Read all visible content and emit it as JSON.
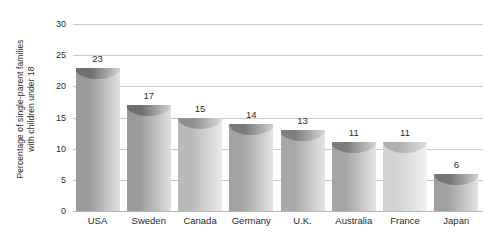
{
  "chart_data": {
    "type": "bar",
    "title": "",
    "xlabel": "",
    "ylabel_line1": "Percentage of single-parent families",
    "ylabel_line2": "with children under 18",
    "categories": [
      "USA",
      "Sweden",
      "Canada",
      "Germany",
      "U.K.",
      "Australia",
      "France",
      "Japan"
    ],
    "values": [
      23,
      17,
      15,
      14,
      13,
      11,
      11,
      6
    ],
    "value_labels": [
      "23",
      "17",
      "15",
      "14",
      "13",
      "11",
      "11",
      "6"
    ],
    "ylim": [
      0,
      30
    ],
    "yticks": [
      0,
      5,
      10,
      15,
      20,
      25,
      30
    ],
    "ytick_labels": [
      "0",
      "5",
      "10",
      "15",
      "20",
      "25",
      "30"
    ],
    "grid": true,
    "legend": "none",
    "bar_colors": [
      "#9a9a9a",
      "#9a9a9a",
      "#b9b9b9",
      "#a3a3a3",
      "#a8a8a8",
      "#a5a5a5",
      "#d2d2d2",
      "#a0a0a0"
    ],
    "bar_cap_colors": [
      "#6f6f6f",
      "#6f6f6f",
      "#8f8f8f",
      "#7a7a7a",
      "#7f7f7f",
      "#7c7c7c",
      "#b0b0b0",
      "#767676"
    ],
    "grid_color": "#c9c9c9",
    "background_color": "#ffffff",
    "text_color": "#2b2b2b"
  }
}
